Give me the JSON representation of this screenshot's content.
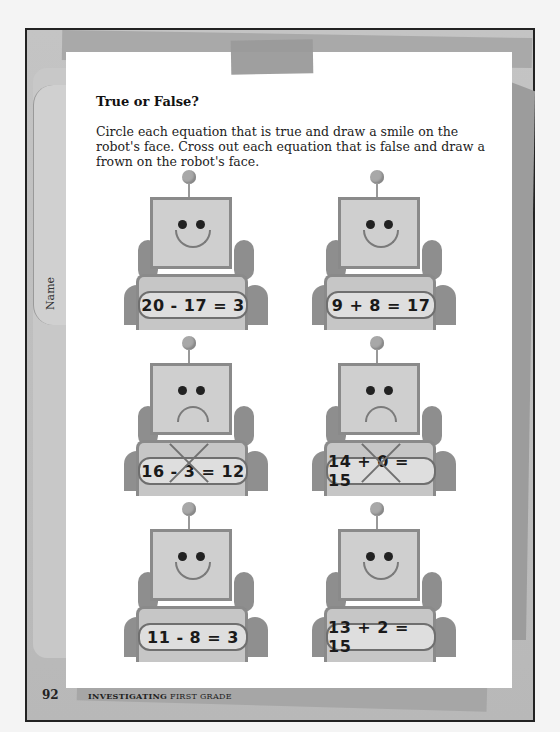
{
  "worksheet": {
    "title": "True or False?",
    "instructions": "Circle each equation that is true and draw a smile on the robot's face. Cross out each equation that is false and draw a frown on the robot's face.",
    "name_label": "Name",
    "page_number": "92",
    "series_bold": "INVESTIGATING",
    "series_rest": "FIRST GRADE"
  },
  "robots": [
    {
      "equation": "20 - 17 = 3",
      "face": "smile",
      "crossed_out": false
    },
    {
      "equation": "9 + 8 = 17",
      "face": "smile",
      "crossed_out": false
    },
    {
      "equation": "16 - 3 = 12",
      "face": "frown",
      "crossed_out": true
    },
    {
      "equation": "14 + 0 = 15",
      "face": "frown",
      "crossed_out": true
    },
    {
      "equation": "11 - 8 = 3",
      "face": "smile",
      "crossed_out": false
    },
    {
      "equation": "13 + 2 = 15",
      "face": "smile",
      "crossed_out": false
    }
  ],
  "colors": {
    "page": "#ffffff",
    "frame_gray": "#bdbdbd",
    "robot_head": "#cfcfcf",
    "text": "#111111"
  }
}
